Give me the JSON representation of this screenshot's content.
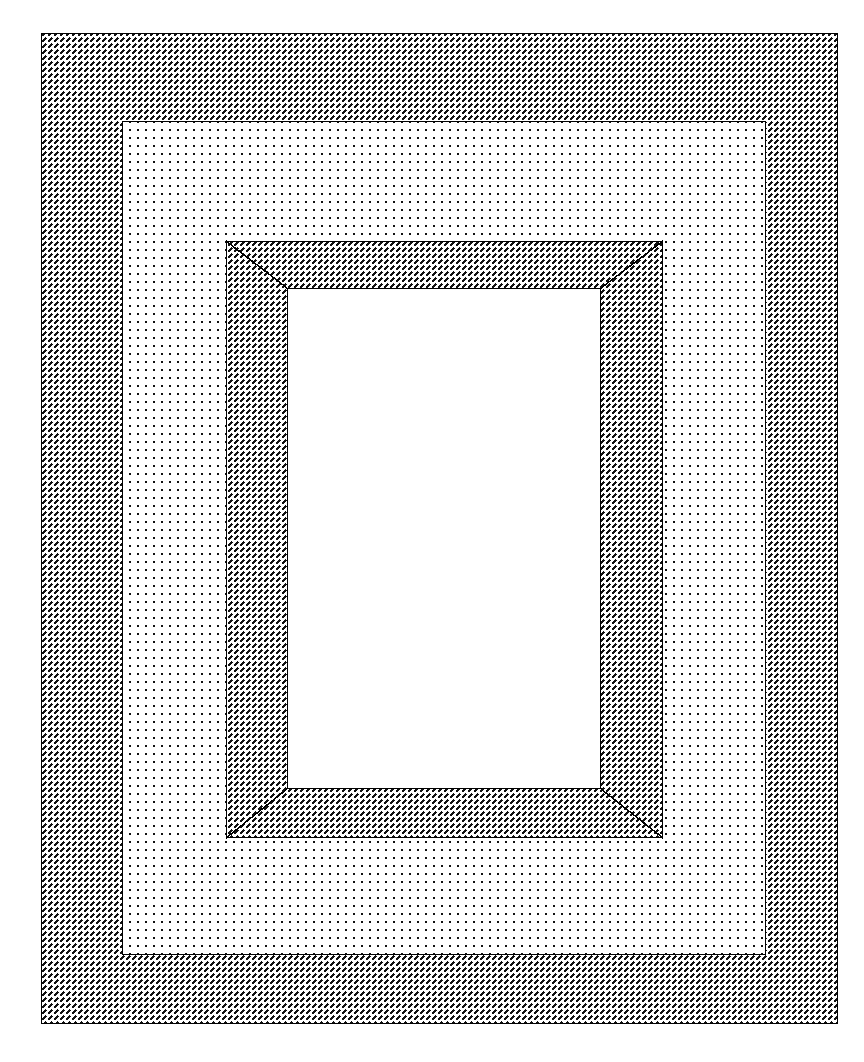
{
  "document": {
    "title": "Frame Mat Cross-Section Drawing",
    "type": "technical-line-drawing",
    "canvas_width": 864,
    "canvas_height": 1062,
    "background_color": "#ffffff",
    "line_color": "#000000"
  },
  "patterns": {
    "hatch": {
      "name": "diagonal-hatch-45",
      "description": "45 degree dashed diagonal hatching, up-to-the-right",
      "tile": 6,
      "stroke_color": "#000000",
      "stroke_width": 1.5
    },
    "stipple": {
      "name": "dot-stipple-grid",
      "description": "regular orthogonal grid of small square dots",
      "tile": 8,
      "dot_size": 1.8,
      "dot_color": "#000000"
    }
  },
  "shapes": [
    {
      "id": "outer-frame-region",
      "label": "Outer frame member",
      "fill": "hatch",
      "x": 41,
      "y": 33,
      "width": 797,
      "height": 991
    },
    {
      "id": "mat-board-region",
      "label": "Mat board",
      "fill": "stipple",
      "x": 122,
      "y": 121,
      "width": 644,
      "height": 834
    },
    {
      "id": "inner-frame-region",
      "label": "Inner frame member with mitered corners",
      "fill": "hatch",
      "x": 226,
      "y": 241,
      "width": 437,
      "height": 597
    },
    {
      "id": "picture-opening",
      "label": "Picture opening",
      "fill": "none",
      "x": 287,
      "y": 288,
      "width": 314,
      "height": 501
    }
  ],
  "miter_lines": [
    {
      "id": "miter-top-left",
      "x1": 226,
      "y1": 241,
      "x2": 287,
      "y2": 288
    },
    {
      "id": "miter-top-right",
      "x1": 663,
      "y1": 241,
      "x2": 601,
      "y2": 288
    },
    {
      "id": "miter-bottom-left",
      "x1": 226,
      "y1": 838,
      "x2": 287,
      "y2": 789
    },
    {
      "id": "miter-bottom-right",
      "x1": 663,
      "y1": 838,
      "x2": 601,
      "y2": 789
    }
  ]
}
